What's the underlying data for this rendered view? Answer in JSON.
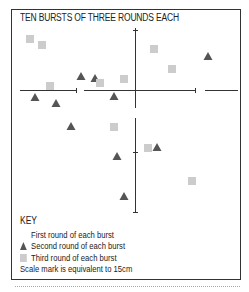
{
  "title": "TEN BURSTS OF THREE ROUNDS EACH",
  "key": {
    "heading": "KEY",
    "items": [
      {
        "symbol": "none",
        "label": "First round of each burst"
      },
      {
        "symbol": "triangle",
        "label": "Second round of each burst"
      },
      {
        "symbol": "square",
        "label": "Third round of each burst"
      }
    ],
    "scale_note": "Scale mark is equivalent to 15cm"
  },
  "colors": {
    "triangle": "#555555",
    "square": "#cccccc",
    "axis": "#333333"
  },
  "chart_data": {
    "type": "scatter",
    "title": "TEN BURSTS OF THREE ROUNDS EACH",
    "origin_px": [
      135,
      90
    ],
    "series": [
      {
        "name": "Second round of each burst",
        "marker": "triangle",
        "points": [
          [
            208,
            56
          ],
          [
            81,
            76
          ],
          [
            95,
            78
          ],
          [
            35,
            97
          ],
          [
            56,
            103
          ],
          [
            114,
            96
          ],
          [
            71,
            126
          ],
          [
            157,
            147
          ],
          [
            117,
            156
          ],
          [
            124,
            196
          ]
        ]
      },
      {
        "name": "Third round of each burst",
        "marker": "square",
        "points": [
          [
            30,
            39
          ],
          [
            42,
            45
          ],
          [
            154,
            49
          ],
          [
            172,
            69
          ],
          [
            50,
            86
          ],
          [
            100,
            83
          ],
          [
            124,
            79
          ],
          [
            114,
            127
          ],
          [
            148,
            148
          ],
          [
            192,
            181
          ]
        ]
      }
    ],
    "note": "Scale mark is equivalent to 15cm"
  }
}
